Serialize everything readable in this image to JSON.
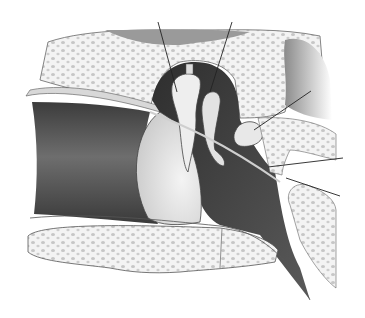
{
  "figure": {
    "style": "grayscale anatomical drawing",
    "labels_visible": false,
    "leader_lines": [
      {
        "id": "line-1",
        "from": [
          158,
          22
        ],
        "to": [
          177,
          92
        ]
      },
      {
        "id": "line-2",
        "from": [
          232,
          22
        ],
        "to": [
          210,
          92
        ]
      },
      {
        "id": "line-3",
        "from": [
          311,
          91
        ],
        "to": [
          254,
          130
        ]
      },
      {
        "id": "line-4",
        "from": [
          343,
          158
        ],
        "to": [
          268,
          167
        ]
      },
      {
        "id": "line-5",
        "from": [
          340,
          196
        ],
        "to": [
          286,
          178
        ]
      }
    ],
    "colors": {
      "background": "#ffffff",
      "bone": "#f2f2f2",
      "bone_spots": "#c4c4c4",
      "canal_dark": "#5e5e5e",
      "cavity_dark": "#4a4a4a",
      "outline": "#333333",
      "leader": "#222222"
    }
  }
}
